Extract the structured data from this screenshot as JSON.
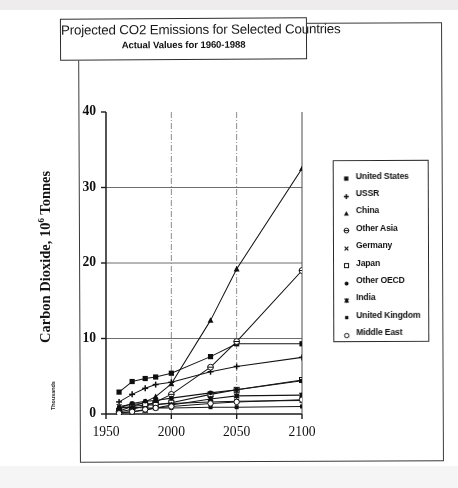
{
  "title": {
    "main": "Projected CO2 Emissions for Selected Countries",
    "sub": "Actual Values for 1960-1988"
  },
  "axes": {
    "ylabel_main": "Carbon Dioxide, 10",
    "ylabel_exp": "6",
    "ylabel_tail": " Tonnes",
    "ylabel_units": "Thousands",
    "yticks": [
      "0",
      "10",
      "20",
      "30",
      "40"
    ],
    "xticks": [
      "1950",
      "2000",
      "2050",
      "2100"
    ]
  },
  "legend": {
    "items": [
      {
        "label": "United States",
        "marker": "filled-square"
      },
      {
        "label": "USSR",
        "marker": "plus"
      },
      {
        "label": "China",
        "marker": "filled-triangle"
      },
      {
        "label": "Other Asia",
        "marker": "open-circle-bar"
      },
      {
        "label": "Germany",
        "marker": "small-cross"
      },
      {
        "label": "Japan",
        "marker": "open-square"
      },
      {
        "label": "Other OECD",
        "marker": "filled-circle"
      },
      {
        "label": "India",
        "marker": "star"
      },
      {
        "label": "United Kingdom",
        "marker": "small-square"
      },
      {
        "label": "Middle East",
        "marker": "open-circle"
      }
    ]
  },
  "chart_data": {
    "type": "line",
    "title": "Projected CO2 Emissions for Selected Countries",
    "subtitle": "Actual Values for 1960-1988",
    "xlabel": "",
    "ylabel": "Carbon Dioxide, 10^6 Tonnes (Thousands)",
    "xlim": [
      1950,
      2100
    ],
    "ylim": [
      0,
      40
    ],
    "xticks": [
      1950,
      2000,
      2050,
      2100
    ],
    "yticks": [
      0,
      10,
      20,
      30,
      40
    ],
    "grid": "horizontal gridlines at 10, 20, 30; vertical dash-dot gridlines at 2000 and 2050",
    "legend_position": "right",
    "x": [
      1960,
      1970,
      1980,
      1988,
      2000,
      2030,
      2050,
      2100
    ],
    "series": [
      {
        "name": "United States",
        "marker": "filled-square",
        "values": [
          2.9,
          4.3,
          4.7,
          4.9,
          5.4,
          7.6,
          9.3,
          9.3
        ]
      },
      {
        "name": "USSR",
        "marker": "plus",
        "values": [
          1.6,
          2.6,
          3.4,
          3.9,
          4.2,
          5.6,
          6.3,
          7.5
        ]
      },
      {
        "name": "China",
        "marker": "filled-triangle",
        "values": [
          0.8,
          1.0,
          1.6,
          2.3,
          4.0,
          12.4,
          19.2,
          32.5
        ]
      },
      {
        "name": "Other Asia",
        "marker": "open-circle-bar",
        "values": [
          0.3,
          0.6,
          1.1,
          1.6,
          2.6,
          6.2,
          9.6,
          19.0
        ]
      },
      {
        "name": "Germany",
        "marker": "small-cross",
        "values": [
          1.0,
          1.3,
          1.4,
          1.3,
          1.4,
          1.6,
          1.7,
          1.8
        ]
      },
      {
        "name": "Japan",
        "marker": "open-square",
        "values": [
          0.4,
          1.0,
          1.2,
          1.2,
          1.5,
          2.6,
          3.2,
          4.5
        ]
      },
      {
        "name": "Other OECD",
        "marker": "filled-circle",
        "values": [
          0.8,
          1.4,
          1.7,
          1.8,
          2.1,
          2.8,
          3.2,
          4.4
        ]
      },
      {
        "name": "India",
        "marker": "star",
        "values": [
          0.2,
          0.3,
          0.5,
          0.8,
          1.2,
          2.0,
          2.4,
          2.5
        ]
      },
      {
        "name": "United Kingdom",
        "marker": "small-square",
        "values": [
          0.8,
          0.9,
          0.8,
          0.8,
          0.8,
          0.9,
          0.9,
          1.0
        ]
      },
      {
        "name": "Middle East",
        "marker": "open-circle",
        "values": [
          0.1,
          0.3,
          0.6,
          0.8,
          1.0,
          1.4,
          1.6,
          1.9
        ]
      }
    ]
  }
}
